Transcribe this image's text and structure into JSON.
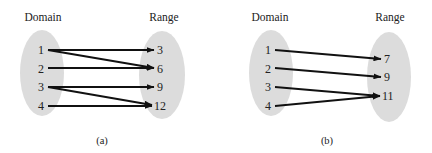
{
  "diagrams": [
    {
      "caption": "(a)",
      "domain_label": "Domain",
      "range_label": "Range",
      "domain": [
        "1",
        "2",
        "3",
        "4"
      ],
      "range": [
        "3",
        "6",
        "9",
        "12"
      ],
      "mappings": [
        {
          "from": "1",
          "to": "3"
        },
        {
          "from": "1",
          "to": "6"
        },
        {
          "from": "2",
          "to": "6"
        },
        {
          "from": "3",
          "to": "9"
        },
        {
          "from": "3",
          "to": "12"
        },
        {
          "from": "4",
          "to": "12"
        }
      ]
    },
    {
      "caption": "(b)",
      "domain_label": "Domain",
      "range_label": "Range",
      "domain": [
        "1",
        "2",
        "3",
        "4"
      ],
      "range": [
        "7",
        "9",
        "11"
      ],
      "mappings": [
        {
          "from": "1",
          "to": "7"
        },
        {
          "from": "2",
          "to": "9"
        },
        {
          "from": "3",
          "to": "11"
        },
        {
          "from": "4",
          "to": "11"
        }
      ]
    }
  ],
  "colors": {
    "ellipse_fill": "#dcdcdc",
    "arrow": "#111111",
    "text": "#222222"
  }
}
